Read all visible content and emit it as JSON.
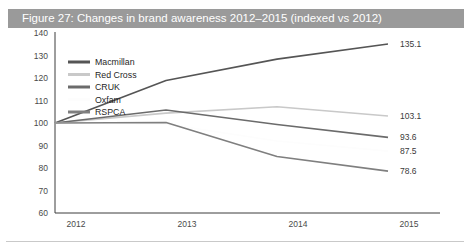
{
  "page": {
    "clipped_text_above": "",
    "title": "Figure 27: Changes in brand awareness 2012–2015 (indexed vs 2012)",
    "title_bar_color": "#9a9a9a",
    "title_text_color": "#ffffff",
    "background_color": "#ffffff"
  },
  "chart_data": {
    "type": "line",
    "title": "Figure 27: Changes in brand awareness 2012–2015 (indexed vs 2012)",
    "xlabel": "",
    "ylabel": "",
    "x": [
      "2012",
      "2013",
      "2014",
      "2015"
    ],
    "categories": [
      "2012",
      "2013",
      "2014",
      "2015"
    ],
    "ylim": [
      60,
      140
    ],
    "yticks": [
      60,
      70,
      80,
      90,
      100,
      110,
      120,
      130,
      140
    ],
    "ytick_labels": [
      "60",
      "70",
      "80",
      "90",
      "100",
      "110",
      "120",
      "130",
      "140"
    ],
    "xtick_labels": [
      "2012",
      "2013",
      "2014",
      "2015"
    ],
    "grid": false,
    "legend_position": "inside upper-left",
    "series": [
      {
        "name": "Macmillan",
        "color": "#555555",
        "values": [
          100.0,
          118.9,
          128.4,
          135.1
        ],
        "end_label": "135.1"
      },
      {
        "name": "Red Cross",
        "color": "#c9c9c9",
        "values": [
          100.0,
          104.4,
          107.2,
          103.1
        ],
        "end_label": "103.1"
      },
      {
        "name": "CRUK",
        "color": "#6b6b6b",
        "values": [
          100.0,
          105.8,
          99.3,
          93.6
        ],
        "end_label": "93.6"
      },
      {
        "name": "Oxfam",
        "color": "#fdfdfd",
        "values": [
          100.0,
          99.5,
          92.0,
          87.5
        ],
        "end_label": "87.5"
      },
      {
        "name": "RSPCA",
        "color": "#7f7f7f",
        "values": [
          100.0,
          100.2,
          85.1,
          78.6
        ],
        "end_label": "78.6"
      }
    ],
    "end_labels": [
      "135.1",
      "103.1",
      "93.6",
      "87.5",
      "78.6"
    ]
  },
  "legend": {
    "items": [
      {
        "label": "Macmillan"
      },
      {
        "label": "Red Cross"
      },
      {
        "label": "CRUK"
      },
      {
        "label": "Oxfam"
      },
      {
        "label": "RSPCA"
      }
    ]
  }
}
